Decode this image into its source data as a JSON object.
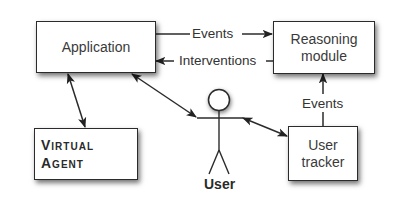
{
  "diagram": {
    "nodes": {
      "application": {
        "label": "Application"
      },
      "reasoning_module": {
        "label": "Reasoning\nmodule"
      },
      "virtual_agent": {
        "label": "Virtual\nAgent"
      },
      "user_tracker": {
        "label": "User\ntracker"
      },
      "user": {
        "label": "User",
        "shape": "stick-figure"
      }
    },
    "edges": [
      {
        "from": "application",
        "to": "reasoning_module",
        "label": "Events",
        "direction": "forward"
      },
      {
        "from": "reasoning_module",
        "to": "application",
        "label": "Interventions",
        "direction": "forward"
      },
      {
        "from": "user_tracker",
        "to": "reasoning_module",
        "label": "Events",
        "direction": "forward"
      },
      {
        "from": "application",
        "to": "virtual_agent",
        "label": "",
        "direction": "bidirectional"
      },
      {
        "from": "application",
        "to": "user",
        "label": "",
        "direction": "bidirectional"
      },
      {
        "from": "user",
        "to": "user_tracker",
        "label": "",
        "direction": "bidirectional"
      }
    ],
    "colors": {
      "stroke": "#2b2b2b",
      "text": "#333333",
      "background": "#ffffff"
    }
  }
}
